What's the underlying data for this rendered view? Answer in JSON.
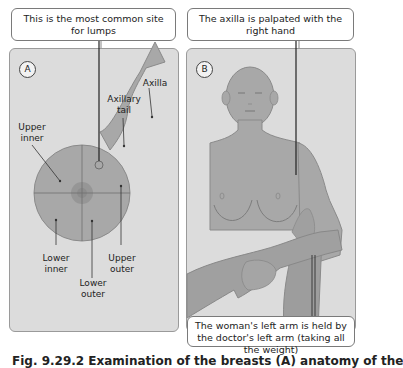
{
  "panel_a": {
    "letter": "A",
    "callout": "This is the most common site for lumps",
    "labels": {
      "axilla": "Axilla",
      "axillary_tail": "Axillary tail",
      "upper_inner": "Upper inner",
      "lower_inner": "Lower inner",
      "lower_outer": "Lower outer",
      "upper_outer": "Upper outer"
    }
  },
  "panel_b": {
    "letter": "B",
    "callout_top": "The axilla is palpated with the right hand",
    "callout_bottom": "The woman's left arm is held by the doctor's left arm (taking all the weight)"
  },
  "caption": "Fig. 9.29.2 Examination of the breasts (A) anatomy of the",
  "colors": {
    "panel_bg": "#dcdcdc",
    "shape_fill": "#a8a8a8",
    "shape_stroke": "#8a8a8a",
    "line": "#333333"
  }
}
